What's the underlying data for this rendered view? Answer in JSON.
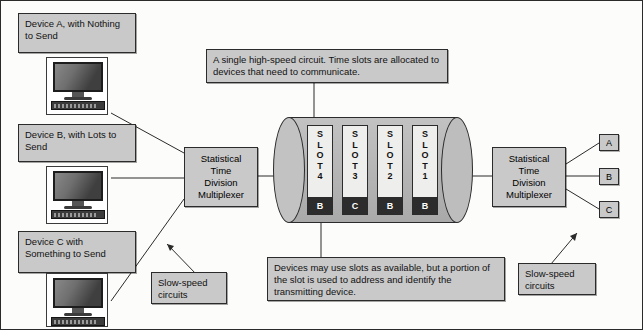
{
  "diagram": {
    "devices": [
      {
        "id": "a",
        "label": "Device A, with Nothing to Send",
        "icon": "computer-icon"
      },
      {
        "id": "b",
        "label": "Device B, with Lots to Send",
        "icon": "computer-icon"
      },
      {
        "id": "c",
        "label": "Device C with Something to Send",
        "icon": "computer-icon"
      }
    ],
    "mux_left": {
      "lines": [
        "Statistical",
        "Time",
        "Division",
        "Multiplexer"
      ]
    },
    "mux_right": {
      "lines": [
        "Statistical",
        "Time",
        "Division",
        "Multiplexer"
      ]
    },
    "cylinder": {
      "name": "high-speed-circuit",
      "slots": [
        {
          "label": "SLOT 4",
          "letters": [
            "S",
            "L",
            "O",
            "T",
            "4"
          ],
          "address": "B"
        },
        {
          "label": "SLOT 3",
          "letters": [
            "S",
            "L",
            "O",
            "T",
            "3"
          ],
          "address": "C"
        },
        {
          "label": "SLOT 2",
          "letters": [
            "S",
            "L",
            "O",
            "T",
            "2"
          ],
          "address": "B"
        },
        {
          "label": "SLOT 1",
          "letters": [
            "S",
            "L",
            "O",
            "T",
            "1"
          ],
          "address": "B"
        }
      ]
    },
    "callout_top": "A single high-speed circuit. Time slots are allocated to devices that need to communicate.",
    "callout_bottom": "Devices may use slots as available, but a portion of the slot is used to address and identify the transmitting device.",
    "slow_left": "Slow-speed circuits",
    "slow_right": "Slow-speed circuits",
    "outputs": [
      {
        "label": "A"
      },
      {
        "label": "B"
      },
      {
        "label": "C"
      }
    ],
    "colors": {
      "box_fill": "#c9c9c9",
      "outline": "#2b2b2b",
      "cylinder_fill": "#bdbdbd",
      "slot_fill": "#eeeeec",
      "address_fill": "#2c2c2c",
      "page_bg": "#fcfcfb"
    }
  }
}
